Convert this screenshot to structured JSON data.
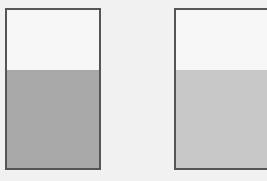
{
  "diagram": {
    "background_color": "#f1f1f1",
    "border_color": "#555555",
    "containers": [
      {
        "id": "left",
        "fill_fraction": 0.62,
        "fill_color": "#a9a9a9",
        "empty_color": "#f7f7f7"
      },
      {
        "id": "right",
        "fill_fraction": 0.62,
        "fill_color": "#c8c8c8",
        "empty_color": "#f7f7f7"
      }
    ]
  }
}
